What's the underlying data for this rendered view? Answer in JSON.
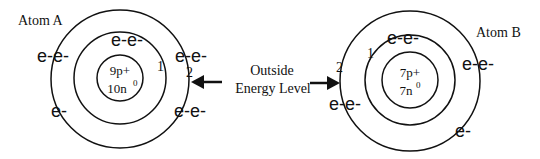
{
  "diagram": {
    "type": "bohr-model-comparison",
    "callout": {
      "line1": "Outside",
      "line2": "Energy Level"
    },
    "atoms": [
      {
        "label": "Atom A",
        "nucleus": {
          "protons": "9p+",
          "neutrons": "10n",
          "neutron_sup": "0"
        },
        "shell_labels": [
          "1",
          "2"
        ],
        "electrons": {
          "shell1_top": "e-e-",
          "outer_left": "e-e-",
          "outer_right_top": "e-e-",
          "outer_bottom_left": "e-",
          "outer_bottom_right": "e-e-"
        }
      },
      {
        "label": "Atom B",
        "nucleus": {
          "protons": "7p+",
          "neutrons": "7n",
          "neutron_sup": "0"
        },
        "shell_labels": [
          "1",
          "2"
        ],
        "electrons": {
          "shell1_top": "e-e-",
          "outer_right": "e-e-",
          "outer_left": "e-e-",
          "outer_bottom_right": "e-"
        }
      }
    ]
  }
}
